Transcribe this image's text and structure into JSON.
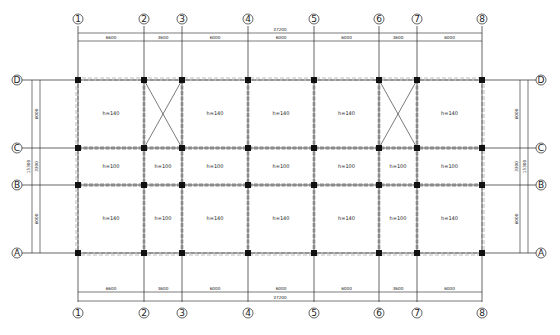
{
  "drawing": {
    "axes_x": [
      {
        "id": "1",
        "label": "①",
        "x": 78
      },
      {
        "id": "2",
        "label": "②",
        "x": 144
      },
      {
        "id": "3",
        "label": "③",
        "x": 182
      },
      {
        "id": "4",
        "label": "④",
        "x": 248
      },
      {
        "id": "5",
        "label": "⑤",
        "x": 314
      },
      {
        "id": "6",
        "label": "⑥",
        "x": 379
      },
      {
        "id": "7",
        "label": "⑦",
        "x": 417
      },
      {
        "id": "8",
        "label": "⑧",
        "x": 482
      }
    ],
    "axes_y": [
      {
        "id": "D",
        "label": "D",
        "y": 80
      },
      {
        "id": "C",
        "label": "C",
        "y": 148
      },
      {
        "id": "B",
        "label": "B",
        "y": 185
      },
      {
        "id": "A",
        "label": "A",
        "y": 253
      }
    ],
    "top_dimensions": {
      "total": "37200",
      "spans": [
        "6600",
        "3600",
        "6000",
        "6000",
        "6000",
        "3600",
        "6000"
      ]
    },
    "bottom_dimensions": {
      "total": "37200",
      "spans": [
        "6600",
        "3600",
        "6000",
        "6000",
        "6000",
        "3600",
        "6000"
      ]
    },
    "left_dimensions": {
      "total": "15300",
      "spans": [
        "6000",
        "3300",
        "6000"
      ]
    },
    "right_dimensions": {
      "total": "15300",
      "spans": [
        "6000",
        "3300",
        "6000"
      ]
    },
    "slabs": [
      {
        "row": "D-C",
        "col": "1-2",
        "label": "h=140"
      },
      {
        "row": "D-C",
        "col": "2-3",
        "label": "",
        "stair_opening": true
      },
      {
        "row": "D-C",
        "col": "3-4",
        "label": "h=140"
      },
      {
        "row": "D-C",
        "col": "4-5",
        "label": "h=140"
      },
      {
        "row": "D-C",
        "col": "5-6",
        "label": "h=140"
      },
      {
        "row": "D-C",
        "col": "6-7",
        "label": "",
        "stair_opening": true
      },
      {
        "row": "D-C",
        "col": "7-8",
        "label": "h=140"
      },
      {
        "row": "C-B",
        "col": "1-2",
        "label": "h=100"
      },
      {
        "row": "C-B",
        "col": "2-3",
        "label": "h=100"
      },
      {
        "row": "C-B",
        "col": "3-4",
        "label": "h=100"
      },
      {
        "row": "C-B",
        "col": "4-5",
        "label": "h=100"
      },
      {
        "row": "C-B",
        "col": "5-6",
        "label": "h=100"
      },
      {
        "row": "C-B",
        "col": "6-7",
        "label": "h=100"
      },
      {
        "row": "C-B",
        "col": "7-8",
        "label": "h=100"
      },
      {
        "row": "B-A",
        "col": "1-2",
        "label": "h=140"
      },
      {
        "row": "B-A",
        "col": "2-3",
        "label": "h=100"
      },
      {
        "row": "B-A",
        "col": "3-4",
        "label": "h=140"
      },
      {
        "row": "B-A",
        "col": "4-5",
        "label": "h=140"
      },
      {
        "row": "B-A",
        "col": "5-6",
        "label": "h=140"
      },
      {
        "row": "B-A",
        "col": "6-7",
        "label": "h=100"
      },
      {
        "row": "B-A",
        "col": "7-8",
        "label": "h=140"
      }
    ],
    "colors": {
      "line": "#222222",
      "beam": "#8a8a8a",
      "column": "#111111",
      "background": "#ffffff"
    }
  }
}
